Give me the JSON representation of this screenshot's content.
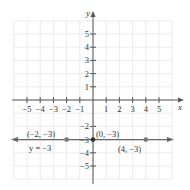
{
  "chart_data": {
    "type": "line",
    "title": "",
    "xlabel": "x",
    "ylabel": "y",
    "xlim": [
      -6,
      6
    ],
    "ylim": [
      -6,
      6
    ],
    "grid": true,
    "x_ticks": [
      -5,
      -4,
      -3,
      -2,
      -1,
      1,
      2,
      3,
      4,
      5
    ],
    "y_ticks": [
      5,
      4,
      3,
      2,
      1,
      -2,
      -3,
      -4,
      -5
    ],
    "x_tick_labels": [
      "−5",
      "−4",
      "−3",
      "−2",
      "−1",
      "1",
      "2",
      "3",
      "4",
      "5"
    ],
    "y_tick_labels": [
      "5",
      "4",
      "3",
      "2",
      "1",
      "−2",
      "−3",
      "−4",
      "−5"
    ],
    "series": [
      {
        "name": "y = −3",
        "kind": "horizontal-line",
        "y": -3,
        "points": [
          {
            "x": -2,
            "y": -3,
            "label": "(−2, −3)"
          },
          {
            "x": 0,
            "y": -3,
            "label": "(0, −3)"
          },
          {
            "x": 4,
            "y": -3,
            "label": "(4, −3)"
          }
        ]
      }
    ],
    "annotations": [
      {
        "text": "y = −3",
        "near": {
          "x": -3.5,
          "y": -3.6
        }
      }
    ]
  },
  "labels": {
    "x_axis": "x",
    "y_axis": "y",
    "line_label": "y = −3",
    "point_a": "(−2, −3)",
    "point_b": "(0, −3)",
    "point_c": "(4, −3)"
  },
  "colors": {
    "axis": "#555555",
    "grid": "#e6e6e6",
    "line": "#666666",
    "point": "#777777"
  }
}
